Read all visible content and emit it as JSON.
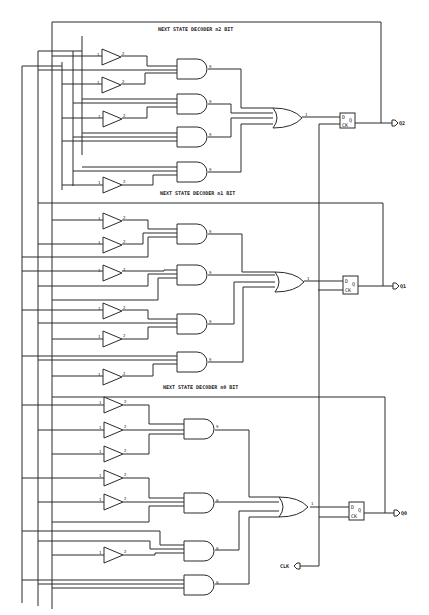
{
  "titles": [
    {
      "text": "NEXT STATE DECODER n2 BIT",
      "x": 158,
      "y": 31
    },
    {
      "text": "NEXT STATE DECODER n1 BIT",
      "x": 160,
      "y": 195
    },
    {
      "text": "NEXT STATE DECODER n0 BIT",
      "x": 163,
      "y": 389
    }
  ],
  "flipflops": [
    {
      "x": 340,
      "y": 113,
      "w": 15,
      "h": 15,
      "d": "D",
      "q": "Q",
      "ck": "CK",
      "out_label": "Q2",
      "out_x": 396,
      "out_y": 123
    },
    {
      "x": 343,
      "y": 276,
      "w": 15,
      "h": 18,
      "d": "D",
      "q": "Q",
      "ck": "CK",
      "out_label": "Q1",
      "out_x": 397,
      "out_y": 286
    },
    {
      "x": 349,
      "y": 502,
      "w": 15,
      "h": 18,
      "d": "D",
      "q": "Q",
      "ck": "CK",
      "out_label": "Q0",
      "out_x": 398,
      "out_y": 513
    }
  ],
  "clock": {
    "label": "CLK",
    "x": 289,
    "y": 566
  },
  "pin_labels": {
    "in": "1",
    "out": "2",
    "and_out": "9",
    "or_out": "1"
  },
  "buses": [
    62,
    38,
    22,
    8
  ],
  "inverters": [
    {
      "x": 102,
      "y": 57
    },
    {
      "x": 102,
      "y": 85
    },
    {
      "x": 103,
      "y": 119
    },
    {
      "x": 103,
      "y": 185
    },
    {
      "x": 103,
      "y": 221
    },
    {
      "x": 103,
      "y": 245
    },
    {
      "x": 103,
      "y": 273
    },
    {
      "x": 103,
      "y": 311
    },
    {
      "x": 103,
      "y": 339
    },
    {
      "x": 103,
      "y": 377
    },
    {
      "x": 104,
      "y": 405
    },
    {
      "x": 104,
      "y": 430
    },
    {
      "x": 104,
      "y": 454
    },
    {
      "x": 104,
      "y": 478
    },
    {
      "x": 104,
      "y": 502
    },
    {
      "x": 104,
      "y": 555
    }
  ],
  "and_gates": [
    {
      "x": 177,
      "y": 59
    },
    {
      "x": 177,
      "y": 94
    },
    {
      "x": 177,
      "y": 127
    },
    {
      "x": 177,
      "y": 162
    },
    {
      "x": 177,
      "y": 224
    },
    {
      "x": 177,
      "y": 265
    },
    {
      "x": 177,
      "y": 314
    },
    {
      "x": 177,
      "y": 352
    },
    {
      "x": 184,
      "y": 419
    },
    {
      "x": 184,
      "y": 493
    },
    {
      "x": 184,
      "y": 541
    },
    {
      "x": 184,
      "y": 575
    }
  ],
  "or_gates": [
    {
      "x": 283,
      "y": 108
    },
    {
      "x": 285,
      "y": 272
    },
    {
      "x": 289,
      "y": 497
    }
  ]
}
